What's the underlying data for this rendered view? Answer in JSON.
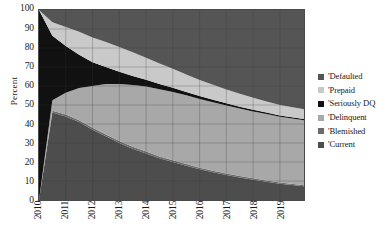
{
  "chart_data": {
    "type": "area",
    "title": "",
    "subtitle": "",
    "xlabel": "",
    "ylabel": "Percent",
    "stacked": true,
    "normalized": true,
    "grid": true,
    "legend_position": "right",
    "xlim": [
      2010,
      2019.9
    ],
    "ylim": [
      0,
      100
    ],
    "x": [
      2010,
      2010.5,
      2011,
      2011.5,
      2012,
      2012.5,
      2013,
      2013.5,
      2014,
      2014.5,
      2015,
      2015.5,
      2016,
      2016.5,
      2017,
      2017.5,
      2018,
      2018.5,
      2019,
      2019.9
    ],
    "x_tick_labels": [
      "2010",
      "2011",
      "2012",
      "2013",
      "2014",
      "2015",
      "2016",
      "2017",
      "2018",
      "2019"
    ],
    "x_ticks": [
      2010,
      2011,
      2012,
      2013,
      2014,
      2015,
      2016,
      2017,
      2018,
      2019
    ],
    "y_ticks": [
      0,
      10,
      20,
      30,
      40,
      50,
      60,
      70,
      80,
      90,
      100
    ],
    "y_tick_labels": [
      "0",
      "10",
      "20",
      "30",
      "40",
      "50",
      "60",
      "70",
      "80",
      "90",
      "100"
    ],
    "series": [
      {
        "name": "'Current",
        "color": "#4d4d4d",
        "order": 1,
        "values": [
          0,
          46,
          44,
          41,
          37,
          33.5,
          30,
          27,
          24.5,
          22,
          20,
          18,
          16.2,
          14.6,
          13.2,
          11.9,
          10.7,
          9.6,
          8.6,
          7.2
        ]
      },
      {
        "name": "'Blemished",
        "color": "#6b6b6b",
        "order": 2,
        "values": [
          0,
          1.0,
          1.0,
          1.0,
          1.0,
          1.0,
          1.0,
          1.0,
          1.0,
          0.9,
          0.9,
          0.9,
          0.8,
          0.8,
          0.8,
          0.7,
          0.7,
          0.7,
          0.6,
          0.6
        ]
      },
      {
        "name": "'Delinquent",
        "color": "#a8a8a8",
        "order": 3,
        "values": [
          0,
          5.5,
          11.5,
          17.0,
          22.0,
          26.5,
          30.0,
          32.5,
          34.2,
          35.4,
          36.0,
          36.2,
          36.2,
          36.0,
          35.8,
          35.5,
          35.2,
          34.9,
          34.6,
          34.2
        ]
      },
      {
        "name": "'Seriously DQ",
        "color": "#111111",
        "order": 4,
        "values": [
          100,
          34.0,
          24.5,
          17.5,
          12.5,
          9.0,
          6.5,
          4.8,
          3.6,
          2.8,
          2.2,
          1.8,
          1.5,
          1.3,
          1.1,
          1.0,
          0.9,
          0.8,
          0.7,
          0.6
        ]
      },
      {
        "name": "'Prepaid",
        "color": "#c9c9c9",
        "order": 5,
        "values": [
          0,
          7.0,
          10.0,
          12.0,
          13.0,
          13.2,
          13.0,
          12.4,
          11.6,
          10.8,
          10.0,
          9.2,
          8.5,
          7.9,
          7.3,
          6.8,
          6.3,
          5.9,
          5.5,
          5.2
        ]
      },
      {
        "name": "'Defaulted",
        "color": "#555555",
        "order": 6,
        "values": [
          0,
          6.5,
          9.0,
          11.5,
          14.5,
          16.8,
          19.5,
          22.3,
          25.1,
          28.1,
          30.9,
          33.9,
          36.8,
          39.4,
          41.8,
          44.1,
          46.2,
          48.1,
          50.0,
          52.2
        ]
      }
    ]
  },
  "legend": {
    "items": [
      {
        "label": "'Defaulted",
        "color": "#555555"
      },
      {
        "label": "'Prepaid",
        "color": "#c9c9c9"
      },
      {
        "label": "'Seriously DQ",
        "color": "#111111"
      },
      {
        "label": "'Delinquent",
        "color": "#a8a8a8"
      },
      {
        "label": "'Blemished",
        "color": "#6b6b6b"
      },
      {
        "label": "'Current",
        "color": "#4d4d4d"
      }
    ]
  }
}
